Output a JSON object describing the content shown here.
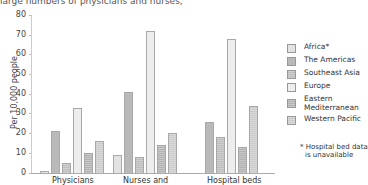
{
  "caption": {
    "left": "large numbers of physicians and nurses,",
    "right": "health workers..."
  },
  "chart_data": {
    "type": "bar",
    "title": "",
    "xlabel": "",
    "ylabel": "Per 10,000 people",
    "ylim": [
      0,
      80
    ],
    "yticks": [
      0,
      10,
      20,
      30,
      40,
      50,
      60,
      70,
      80
    ],
    "grid": false,
    "legend_position": "right",
    "categories": [
      "Physicians",
      "Nurses and",
      "Hospital beds"
    ],
    "series": [
      {
        "name": "Africa*",
        "values": [
          1,
          9,
          null
        ]
      },
      {
        "name": "The Americas",
        "values": [
          21.5,
          41,
          26
        ]
      },
      {
        "name": "Southeast Asia",
        "values": [
          5,
          8,
          18
        ]
      },
      {
        "name": "Europe",
        "values": [
          33,
          72,
          68
        ]
      },
      {
        "name": "Eastern Mediterranean",
        "values": [
          10,
          14,
          13
        ]
      },
      {
        "name": "Western Pacific",
        "values": [
          16,
          20,
          34
        ]
      }
    ],
    "annotations": [
      "* Hospital bed data is unavailable"
    ]
  },
  "yaxis": {
    "label": "Per 10,000 people",
    "ticks": [
      "0",
      "10",
      "20",
      "30",
      "40",
      "50",
      "60",
      "70",
      "80"
    ]
  },
  "xaxis": {
    "labels": [
      "Physicians",
      "Nurses and",
      "Hospital beds"
    ]
  },
  "legend": {
    "items": [
      {
        "label": "Africa*"
      },
      {
        "label": "The Americas"
      },
      {
        "label": "Southeast Asia"
      },
      {
        "label": "Europe"
      },
      {
        "label": "Eastern",
        "label2": "Mediterranean"
      },
      {
        "label": "Western Pacific"
      }
    ]
  },
  "note": {
    "line1": "* Hospital bed data",
    "line2": "  is unavailable"
  }
}
